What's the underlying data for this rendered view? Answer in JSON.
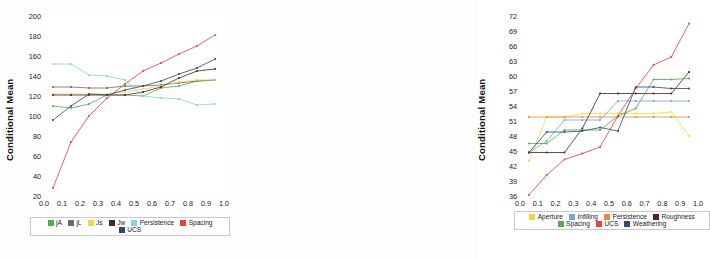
{
  "figure": {
    "ylabel": "Conditional Mean",
    "panel_a_letter": "(a)",
    "panel_b_letter": "(b)"
  },
  "chart_data": [
    {
      "type": "line",
      "panel": "(a)",
      "title": "",
      "xlabel": "",
      "ylabel": "Conditional Mean",
      "xlim": [
        0.0,
        1.0
      ],
      "ylim": [
        20,
        200
      ],
      "xticks": [
        "0.0",
        "0.1",
        "0.2",
        "0.3",
        "0.4",
        "0.5",
        "0.6",
        "0.7",
        "0.8",
        "0.9",
        "1.0"
      ],
      "yticks": [
        "20",
        "40",
        "60",
        "80",
        "100",
        "120",
        "140",
        "160",
        "180",
        "200"
      ],
      "grid": false,
      "legend_position": "bottom",
      "x": [
        0.05,
        0.15,
        0.25,
        0.35,
        0.45,
        0.55,
        0.65,
        0.75,
        0.85,
        0.95
      ],
      "series": [
        {
          "name": "jA",
          "color": "#4caf50",
          "values": [
            110,
            108,
            112,
            121,
            121,
            120,
            128,
            130,
            135,
            136
          ]
        },
        {
          "name": "jL",
          "color": "#6b6b6b",
          "values": [
            129,
            129,
            128,
            128,
            130,
            130,
            131,
            133,
            135,
            136
          ]
        },
        {
          "name": "Js",
          "color": "#f5d73c",
          "values": [
            122,
            122,
            122,
            122,
            124,
            127,
            130,
            134,
            136,
            136
          ]
        },
        {
          "name": "Jw",
          "color": "#5a1f2e",
          "values": [
            121,
            121,
            121,
            121,
            121,
            124,
            129,
            138,
            145,
            147
          ]
        },
        {
          "name": "Persistence",
          "color": "#7fd4e8",
          "values": [
            152,
            152,
            141,
            140,
            136,
            120,
            118,
            117,
            111,
            112
          ]
        },
        {
          "name": "Spacing",
          "color": "#ef4136",
          "values": [
            28,
            74,
            100,
            118,
            132,
            145,
            153,
            162,
            170,
            181
          ]
        },
        {
          "name": "UCS",
          "color": "#2e4a7d",
          "values": [
            96,
            110,
            122,
            121,
            126,
            130,
            135,
            142,
            148,
            157
          ]
        }
      ]
    },
    {
      "type": "line",
      "panel": "(b)",
      "title": "",
      "xlabel": "",
      "ylabel": "Conditional Mean",
      "xlim": [
        0.0,
        1.0
      ],
      "ylim": [
        36,
        72
      ],
      "xticks": [
        "0.0",
        "0.1",
        "0.2",
        "0.3",
        "0.4",
        "0.5",
        "0.6",
        "0.7",
        "0.8",
        "0.9",
        "1.0"
      ],
      "yticks": [
        "36",
        "39",
        "42",
        "45",
        "48",
        "51",
        "54",
        "57",
        "60",
        "63",
        "66",
        "69",
        "72"
      ],
      "grid": false,
      "legend_position": "bottom",
      "x": [
        0.05,
        0.15,
        0.25,
        0.35,
        0.45,
        0.55,
        0.65,
        0.75,
        0.85,
        0.95
      ],
      "series": [
        {
          "name": "Aperture",
          "color": "#f5d73c",
          "values": [
            43.0,
            51.8,
            51.8,
            52.5,
            52.5,
            52.5,
            52.5,
            52.5,
            52.8,
            48.0
          ]
        },
        {
          "name": "Infilling",
          "color": "#6fa8dc",
          "values": [
            44.7,
            47.0,
            51.2,
            51.2,
            51.2,
            55.0,
            55.0,
            55.0,
            55.0,
            55.0
          ]
        },
        {
          "name": "Persistence",
          "color": "#f0883c",
          "values": [
            51.8,
            51.8,
            51.8,
            51.8,
            51.8,
            51.8,
            51.8,
            51.8,
            51.8,
            51.8
          ]
        },
        {
          "name": "Roughness",
          "color": "#5a1f2e",
          "values": [
            44.7,
            44.7,
            44.7,
            49.5,
            56.5,
            56.5,
            56.5,
            56.5,
            56.5,
            60.8
          ]
        },
        {
          "name": "Spacing",
          "color": "#4caf50",
          "values": [
            46.5,
            46.5,
            49.2,
            49.2,
            49.2,
            52.0,
            53.5,
            59.3,
            59.3,
            59.5
          ]
        },
        {
          "name": "UCS",
          "color": "#ef4136",
          "values": [
            36.2,
            40.2,
            43.3,
            44.5,
            45.8,
            52.0,
            57.5,
            62.2,
            63.8,
            70.5
          ]
        },
        {
          "name": "Weathering",
          "color": "#2e4a7d",
          "values": [
            44.7,
            48.8,
            48.8,
            49.0,
            49.7,
            49.0,
            57.8,
            57.8,
            57.5,
            57.5
          ]
        }
      ]
    }
  ],
  "legends": {
    "panel_a": [
      {
        "label": "jA",
        "color": "#4caf50"
      },
      {
        "label": "jL",
        "color": "#6b6b6b"
      },
      {
        "label": "Js",
        "color": "#f5d73c"
      },
      {
        "label": "Jw",
        "color": "#5a1f2e"
      },
      {
        "label": "Persistence",
        "color": "#7fd4e8"
      },
      {
        "label": "Spacing",
        "color": "#ef4136"
      },
      {
        "label": "UCS",
        "color": "#2e4a7d"
      }
    ],
    "panel_b": [
      {
        "label": "Aperture",
        "color": "#f5d73c"
      },
      {
        "label": "Infilling",
        "color": "#6fa8dc"
      },
      {
        "label": "Persistence",
        "color": "#f0883c"
      },
      {
        "label": "Roughness",
        "color": "#5a1f2e"
      },
      {
        "label": "Spacing",
        "color": "#4caf50"
      },
      {
        "label": "UCS",
        "color": "#ef4136"
      },
      {
        "label": "Weathering",
        "color": "#2e4a7d"
      }
    ]
  }
}
